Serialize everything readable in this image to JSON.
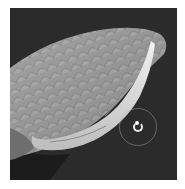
{
  "viewport": {
    "label": "3D sculpt viewport",
    "background_color": "#2b2b2b",
    "mesh": {
      "description": "scaled leaf/wing shaped sculpted mesh",
      "surface_color": "#9a9a9a",
      "inner_band_color": "#e6e6e6"
    },
    "brush_cursor": {
      "icon": "rotate-brush-cursor-icon",
      "ring_color": "#aaaaaa"
    }
  }
}
